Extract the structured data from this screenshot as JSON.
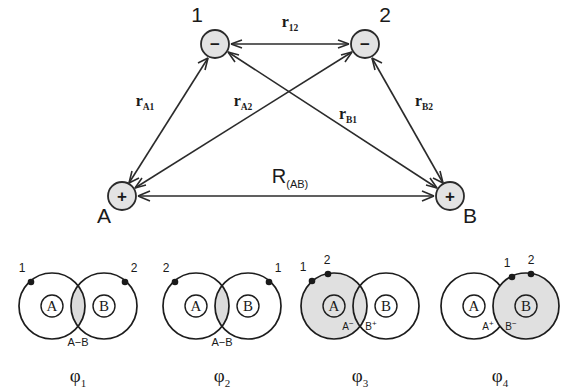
{
  "figure": {
    "stroke_color": "#2b2b2b",
    "node_fill": "#e3e3e3",
    "shade_fill": "#e0e0e0",
    "background": "#ffffff"
  },
  "top_diagram": {
    "nodes": [
      {
        "id": "e1",
        "label": "1",
        "sign": "−",
        "cx": 215,
        "cy": 44,
        "r": 14,
        "label_x": 197,
        "label_y": 22
      },
      {
        "id": "e2",
        "label": "2",
        "sign": "−",
        "cx": 365,
        "cy": 44,
        "r": 14,
        "label_x": 385,
        "label_y": 22
      },
      {
        "id": "nA",
        "label": "A",
        "sign": "+",
        "cx": 122,
        "cy": 196,
        "r": 14,
        "label_x": 104,
        "label_y": 223
      },
      {
        "id": "nB",
        "label": "B",
        "sign": "+",
        "cx": 450,
        "cy": 196,
        "r": 14,
        "label_x": 470,
        "label_y": 223
      }
    ],
    "edges": [
      {
        "id": "r12",
        "from": "e1",
        "to": "e2",
        "base": "r",
        "sub": "12",
        "label_x": 290,
        "label_y": 27
      },
      {
        "id": "rA1",
        "from": "nA",
        "to": "e1",
        "base": "r",
        "sub": "A1",
        "label_x": 145,
        "label_y": 106
      },
      {
        "id": "rA2",
        "from": "nA",
        "to": "e2",
        "base": "r",
        "sub": "A2",
        "label_x": 243,
        "label_y": 106
      },
      {
        "id": "rB1",
        "from": "nB",
        "to": "e1",
        "base": "r",
        "sub": "B1",
        "label_x": 348,
        "label_y": 119
      },
      {
        "id": "rB2",
        "from": "nB",
        "to": "e2",
        "base": "r",
        "sub": "B2",
        "label_x": 424,
        "label_y": 106
      },
      {
        "id": "RAB",
        "from": "nA",
        "to": "nB",
        "base": "R",
        "sub": "(AB)",
        "label_x": 290,
        "label_y": 183,
        "big": true
      }
    ],
    "arrow_style": "double-headed"
  },
  "structures": [
    {
      "id": "phi1",
      "phi_base": "φ",
      "phi_sub": "1",
      "phi_x": 78,
      "phi_y": 382,
      "left_atom": "A",
      "right_atom": "B",
      "left_shaded": false,
      "right_shaded": false,
      "lens_shaded": true,
      "left_dot_label": "1",
      "right_dot_label": "2",
      "left_dot_on": "left",
      "right_dot_on": "right",
      "bottom_label": "A−B",
      "bottom_label_x": 78,
      "bottom_label_y": 346,
      "left_charge": "",
      "right_charge": "",
      "cxA": 52,
      "cxB": 104,
      "cy": 306,
      "r": 33
    },
    {
      "id": "phi2",
      "phi_base": "φ",
      "phi_sub": "2",
      "phi_x": 222,
      "phi_y": 382,
      "left_atom": "A",
      "right_atom": "B",
      "left_shaded": false,
      "right_shaded": false,
      "lens_shaded": true,
      "left_dot_label": "2",
      "right_dot_label": "1",
      "left_dot_on": "left",
      "right_dot_on": "right",
      "bottom_label": "A−B",
      "bottom_label_x": 222,
      "bottom_label_y": 346,
      "left_charge": "",
      "right_charge": "",
      "cxA": 196,
      "cxB": 248,
      "cy": 306,
      "r": 33
    },
    {
      "id": "phi3",
      "phi_base": "φ",
      "phi_sub": "3",
      "phi_x": 360,
      "phi_y": 382,
      "left_atom": "A",
      "right_atom": "B",
      "left_shaded": true,
      "right_shaded": false,
      "lens_shaded": false,
      "left_dot_label": "1",
      "right_dot_label": "2",
      "left_dot_on": "left",
      "right_dot_on": "left",
      "bottom_label": "",
      "bottom_label_x": 360,
      "bottom_label_y": 346,
      "left_charge": "A",
      "left_charge_sup": "−",
      "right_charge": "B",
      "right_charge_sup": "+",
      "cxA": 334,
      "cxB": 386,
      "cy": 306,
      "r": 33
    },
    {
      "id": "phi4",
      "phi_base": "φ",
      "phi_sub": "4",
      "phi_x": 500,
      "phi_y": 382,
      "left_atom": "A",
      "right_atom": "B",
      "left_shaded": false,
      "right_shaded": true,
      "lens_shaded": false,
      "left_dot_label": "1",
      "right_dot_label": "2",
      "left_dot_on": "right",
      "right_dot_on": "right",
      "bottom_label": "",
      "bottom_label_x": 500,
      "bottom_label_y": 346,
      "left_charge": "A",
      "left_charge_sup": "+",
      "right_charge": "B",
      "right_charge_sup": "−",
      "cxA": 474,
      "cxB": 526,
      "cy": 306,
      "r": 33
    }
  ]
}
